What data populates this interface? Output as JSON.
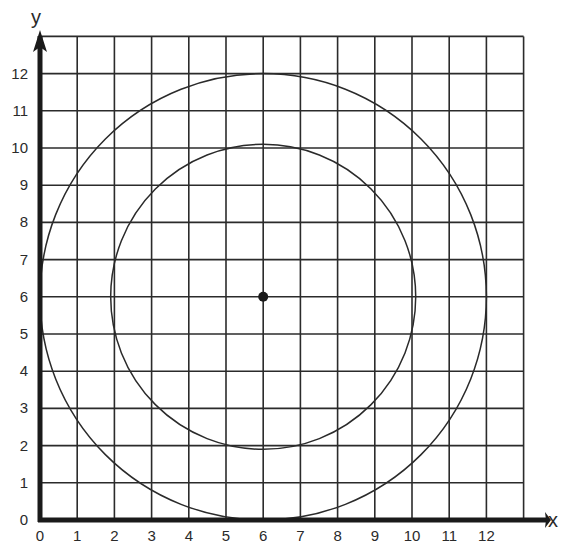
{
  "diagram": {
    "type": "coordinate-grid-with-circles",
    "axes": {
      "x_label": "x",
      "y_label": "y",
      "x_ticks": [
        "0",
        "1",
        "2",
        "3",
        "4",
        "5",
        "6",
        "7",
        "8",
        "9",
        "10",
        "11",
        "12"
      ],
      "y_ticks": [
        "0",
        "1",
        "2",
        "3",
        "4",
        "5",
        "6",
        "7",
        "8",
        "9",
        "10",
        "11",
        "12"
      ],
      "grid_extent": {
        "x_max": 13,
        "y_max": 13
      }
    },
    "center_point": {
      "x": 6,
      "y": 6
    },
    "circles": [
      {
        "name": "outer-circle",
        "cx": 6,
        "cy": 6,
        "r": 6
      },
      {
        "name": "inner-circle",
        "cx": 6,
        "cy": 6,
        "r": 4.1
      }
    ],
    "colors": {
      "grid": "#2b2b2b",
      "axis": "#1a1a1a",
      "circle": "#2a2a2a",
      "text": "#2a2a2a",
      "background": "#ffffff"
    }
  }
}
